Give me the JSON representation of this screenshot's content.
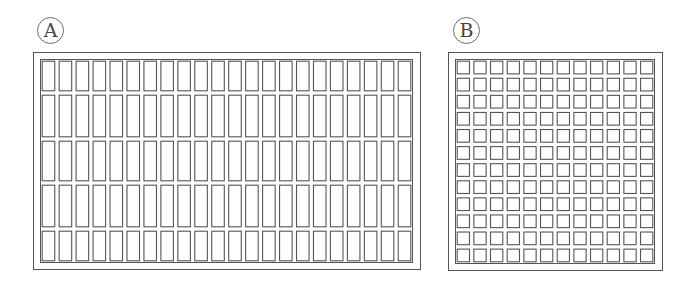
{
  "figure": {
    "background": "#ffffff",
    "line_color": "#555555",
    "panels": [
      {
        "id": "A",
        "label": "A",
        "label_center": [
          50,
          30
        ],
        "outer_frame": {
          "x": 33,
          "y": 52,
          "w": 388,
          "h": 218
        },
        "inner_grid": {
          "x": 40,
          "y": 59,
          "w": 373,
          "h": 204
        },
        "columns": 22,
        "rows": 5,
        "row_heights": [
          34,
          46,
          44,
          46,
          34
        ],
        "cell_shape": "tall rectangle"
      },
      {
        "id": "B",
        "label": "B",
        "label_center": [
          466,
          30
        ],
        "outer_frame": {
          "x": 448,
          "y": 52,
          "w": 215,
          "h": 219
        },
        "inner_grid": {
          "x": 455,
          "y": 59,
          "w": 200,
          "h": 205
        },
        "columns": 12,
        "rows": 12,
        "cell_shape": "square"
      }
    ]
  }
}
